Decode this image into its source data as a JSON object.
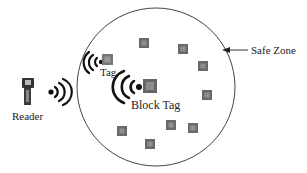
{
  "diagram": {
    "labels": {
      "reader": "Reader",
      "tag": "Tag",
      "block_tag": "Block Tag",
      "safe_zone": "Safe Zone"
    },
    "zone": {
      "shape": "circle",
      "cx": 156,
      "cy": 87,
      "r": 79,
      "stroke": "#444444"
    },
    "tags": [
      {
        "x": 144,
        "y": 43
      },
      {
        "x": 183,
        "y": 49
      },
      {
        "x": 203,
        "y": 66
      },
      {
        "x": 207,
        "y": 95
      },
      {
        "x": 193,
        "y": 128
      },
      {
        "x": 171,
        "y": 125
      },
      {
        "x": 150,
        "y": 144
      },
      {
        "x": 122,
        "y": 131
      }
    ],
    "active_tag": {
      "x": 108,
      "y": 60
    },
    "block_tag_pos": {
      "x": 150,
      "y": 86
    },
    "tag_color": "#6a6a6a"
  }
}
